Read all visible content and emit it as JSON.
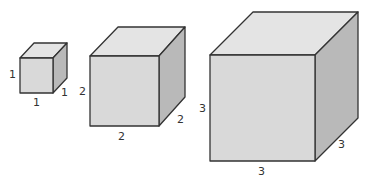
{
  "diagram": {
    "title": "",
    "cubes": [
      {
        "name": "cube-1",
        "labels": {
          "height": "1",
          "width": "1",
          "depth": "1"
        }
      },
      {
        "name": "cube-2",
        "labels": {
          "height": "2",
          "width": "2",
          "depth": "2"
        }
      },
      {
        "name": "cube-3",
        "labels": {
          "height": "3",
          "width": "3",
          "depth": "3"
        }
      }
    ],
    "colors": {
      "front_face": "#d9d9d9",
      "top_face": "#e4e4e4",
      "side_face": "#b9b9b9",
      "edge": "#333333"
    }
  }
}
